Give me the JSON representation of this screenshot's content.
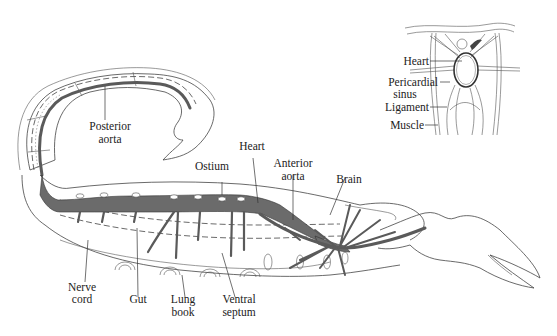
{
  "figure": {
    "colors": {
      "vessel_fill": "#6b6b6b",
      "outline": "#444444",
      "background": "#ffffff"
    }
  },
  "main_labels": {
    "posterior_aorta": [
      "Posterior",
      "aorta"
    ],
    "ostium": [
      "Ostium"
    ],
    "heart": [
      "Heart"
    ],
    "anterior_aorta": [
      "Anterior",
      "aorta"
    ],
    "brain": [
      "Brain"
    ],
    "nerve_cord": [
      "Nerve",
      "cord"
    ],
    "gut": [
      "Gut"
    ],
    "lung_book": [
      "Lung",
      "book"
    ],
    "ventral_septum": [
      "Ventral",
      "septum"
    ]
  },
  "inset_labels": {
    "heart": [
      "Heart"
    ],
    "pericardial_sinus": [
      "Pericardial",
      "sinus"
    ],
    "ligament": [
      "Ligament"
    ],
    "muscle": [
      "Muscle"
    ]
  }
}
